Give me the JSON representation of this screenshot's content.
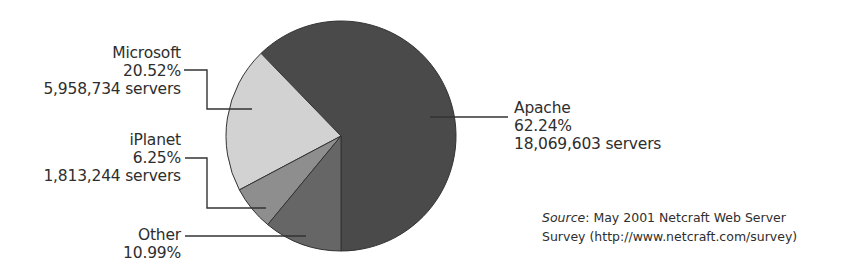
{
  "chart_data": {
    "type": "pie",
    "title": "",
    "categories": [
      "Apache",
      "Microsoft",
      "iPlanet",
      "Other"
    ],
    "values": [
      62.24,
      20.52,
      6.25,
      10.99
    ],
    "unit": "%",
    "servers": {
      "Apache": "18,069,603",
      "Microsoft": "5,958,734",
      "iPlanet": "1,813,244"
    },
    "colors": {
      "Apache": "#4a4a4a",
      "Microsoft": "#d2d2d2",
      "iPlanet": "#8e8e8e",
      "Other": "#666666"
    },
    "legend_position": "callout labels",
    "annotation": "Source: May 2001 Netcraft Web Server Survey (http://www.netcraft.com/survey)"
  },
  "labels": {
    "apache": {
      "name": "Apache",
      "pct": "62.24%",
      "servers": "18,069,603 servers"
    },
    "microsoft": {
      "name": "Microsoft",
      "pct": "20.52%",
      "servers": "5,958,734 servers"
    },
    "iplanet": {
      "name": "iPlanet",
      "pct": "6.25%",
      "servers": "1,813,244 servers"
    },
    "other": {
      "name": "Other",
      "pct": "10.99%"
    }
  },
  "source": {
    "prefix": "Source",
    "line1_rest": ": May 2001 Netcraft Web Server",
    "line2": "Survey (http://www.netcraft.com/survey)"
  }
}
